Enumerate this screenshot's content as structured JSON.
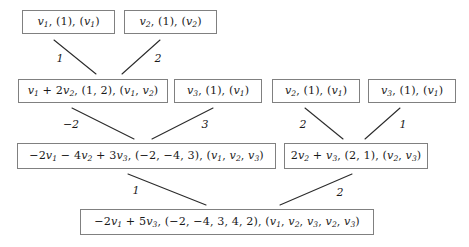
{
  "diagram": {
    "type": "directed-acyclic-graph",
    "edge_color": "#2b2b2b",
    "box_border_color": "#808080",
    "text_color": "#1a1a1a",
    "background": "#ffffff",
    "nodes": [
      {
        "id": "n1",
        "level": 0,
        "text": "v1, (1), (v1)",
        "parts": [
          {
            "t": "v",
            "sub": "1"
          },
          {
            "t": ", (1), ("
          },
          {
            "t": "v",
            "sub": "1"
          },
          {
            "t": ")"
          }
        ],
        "x": 22,
        "y": 10,
        "w": 93,
        "h": 24
      },
      {
        "id": "n2",
        "level": 0,
        "text": "v2, (1), (v2)",
        "parts": [
          {
            "t": "v",
            "sub": "2"
          },
          {
            "t": ", (1), ("
          },
          {
            "t": "v",
            "sub": "2"
          },
          {
            "t": ")"
          }
        ],
        "x": 124,
        "y": 10,
        "w": 93,
        "h": 24
      },
      {
        "id": "n3",
        "level": 1,
        "text": "v1 + 2v2, (1,2), (v1,v2)",
        "parts": [
          {
            "t": "v",
            "sub": "1"
          },
          {
            "t": " + 2"
          },
          {
            "t": "v",
            "sub": "2"
          },
          {
            "t": ", (1, 2), ("
          },
          {
            "t": "v",
            "sub": "1"
          },
          {
            "t": ", "
          },
          {
            "t": "v",
            "sub": "2"
          },
          {
            "t": ")"
          }
        ],
        "x": 18,
        "y": 79,
        "w": 150,
        "h": 24
      },
      {
        "id": "n4",
        "level": 1,
        "text": "v3, (1), (v1)",
        "parts": [
          {
            "t": "v",
            "sub": "3"
          },
          {
            "t": ", (1), ("
          },
          {
            "t": "v",
            "sub": "1"
          },
          {
            "t": ")"
          }
        ],
        "x": 174,
        "y": 79,
        "w": 88,
        "h": 24
      },
      {
        "id": "n5",
        "level": 1,
        "text": "v2, (1), (v1)",
        "parts": [
          {
            "t": "v",
            "sub": "2"
          },
          {
            "t": ", (1), ("
          },
          {
            "t": "v",
            "sub": "1"
          },
          {
            "t": ")"
          }
        ],
        "x": 272,
        "y": 79,
        "w": 88,
        "h": 24
      },
      {
        "id": "n6",
        "level": 1,
        "text": "v3, (1), (v1)",
        "parts": [
          {
            "t": "v",
            "sub": "3"
          },
          {
            "t": ", (1), ("
          },
          {
            "t": "v",
            "sub": "1"
          },
          {
            "t": ")"
          }
        ],
        "x": 368,
        "y": 79,
        "w": 88,
        "h": 24
      },
      {
        "id": "n7",
        "level": 2,
        "text": "-2v1 - 4v2 + 3v3, (-2,-4,3), (v1,v2,v3)",
        "parts": [
          {
            "t": "−2"
          },
          {
            "t": "v",
            "sub": "1"
          },
          {
            "t": " − 4"
          },
          {
            "t": "v",
            "sub": "2"
          },
          {
            "t": " + 3"
          },
          {
            "t": "v",
            "sub": "3"
          },
          {
            "t": ", (−2, −4, 3), ("
          },
          {
            "t": "v",
            "sub": "1"
          },
          {
            "t": ", "
          },
          {
            "t": "v",
            "sub": "2"
          },
          {
            "t": ", "
          },
          {
            "t": "v",
            "sub": "3"
          },
          {
            "t": ")"
          }
        ],
        "x": 17,
        "y": 143,
        "w": 259,
        "h": 26
      },
      {
        "id": "n8",
        "level": 2,
        "text": "2v2 + v3, (2,1), (v2,v3)",
        "parts": [
          {
            "t": "2"
          },
          {
            "t": "v",
            "sub": "2"
          },
          {
            "t": " + "
          },
          {
            "t": "v",
            "sub": "3"
          },
          {
            "t": ", (2, 1), ("
          },
          {
            "t": "v",
            "sub": "2"
          },
          {
            "t": ", "
          },
          {
            "t": "v",
            "sub": "3"
          },
          {
            "t": ")"
          }
        ],
        "x": 284,
        "y": 143,
        "w": 144,
        "h": 26
      },
      {
        "id": "n9",
        "level": 3,
        "text": "-2v1 + 5v3, (-2,-4,3,4,2), (v1,v2,v3,v2,v3)",
        "parts": [
          {
            "t": "−2"
          },
          {
            "t": "v",
            "sub": "1"
          },
          {
            "t": " + 5"
          },
          {
            "t": "v",
            "sub": "3"
          },
          {
            "t": ", (−2, −4, 3, 4, 2), ("
          },
          {
            "t": "v",
            "sub": "1"
          },
          {
            "t": ", "
          },
          {
            "t": "v",
            "sub": "2"
          },
          {
            "t": ", "
          },
          {
            "t": "v",
            "sub": "3"
          },
          {
            "t": ", "
          },
          {
            "t": "v",
            "sub": "2"
          },
          {
            "t": ", "
          },
          {
            "t": "v",
            "sub": "3"
          },
          {
            "t": ")"
          }
        ],
        "x": 80,
        "y": 209,
        "w": 294,
        "h": 26
      }
    ],
    "edges": [
      {
        "id": "e1",
        "from": "n1",
        "to": "n3",
        "label": "1",
        "x1": 54,
        "y1": 40,
        "x2": 96,
        "y2": 74,
        "lx": 60,
        "ly": 58
      },
      {
        "id": "e2",
        "from": "n2",
        "to": "n3",
        "label": "2",
        "x1": 160,
        "y1": 40,
        "x2": 122,
        "y2": 74,
        "lx": 158,
        "ly": 58
      },
      {
        "id": "e3",
        "from": "n3",
        "to": "n7",
        "label": "−2",
        "x1": 72,
        "y1": 108,
        "x2": 134,
        "y2": 139,
        "lx": 71,
        "ly": 124
      },
      {
        "id": "e4",
        "from": "n4",
        "to": "n7",
        "label": "3",
        "x1": 213,
        "y1": 108,
        "x2": 152,
        "y2": 139,
        "lx": 205,
        "ly": 124
      },
      {
        "id": "e5",
        "from": "n5",
        "to": "n8",
        "label": "2",
        "x1": 305,
        "y1": 108,
        "x2": 343,
        "y2": 139,
        "lx": 303,
        "ly": 124
      },
      {
        "id": "e6",
        "from": "n6",
        "to": "n8",
        "label": "1",
        "x1": 400,
        "y1": 108,
        "x2": 365,
        "y2": 139,
        "lx": 403,
        "ly": 124
      },
      {
        "id": "e7",
        "from": "n7",
        "to": "n9",
        "label": "1",
        "x1": 128,
        "y1": 174,
        "x2": 206,
        "y2": 205,
        "lx": 136,
        "ly": 190
      },
      {
        "id": "e8",
        "from": "n8",
        "to": "n9",
        "label": "2",
        "x1": 352,
        "y1": 174,
        "x2": 280,
        "y2": 205,
        "lx": 340,
        "ly": 192
      }
    ]
  }
}
